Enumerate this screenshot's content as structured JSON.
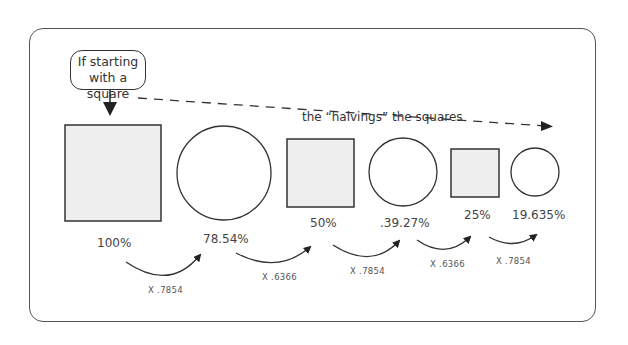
{
  "diagram": {
    "callout_text_line1": "If starting",
    "callout_text_line2": "with a square",
    "trend_label": "the “halvings” the squares",
    "shapes": [
      {
        "type": "square",
        "label": "100%"
      },
      {
        "type": "circle",
        "label": "78.54%"
      },
      {
        "type": "square",
        "label": "50%"
      },
      {
        "type": "circle",
        "label": ".39.27%"
      },
      {
        "type": "square",
        "label": "25%"
      },
      {
        "type": "circle",
        "label": "19.635%"
      }
    ],
    "multipliers": [
      "X .7854",
      "X .6366",
      "X .7854",
      "X .6366",
      "X .7854"
    ],
    "colors": {
      "square_fill": "#eeeeee",
      "stroke": "#333333",
      "frame": "#555555"
    }
  }
}
